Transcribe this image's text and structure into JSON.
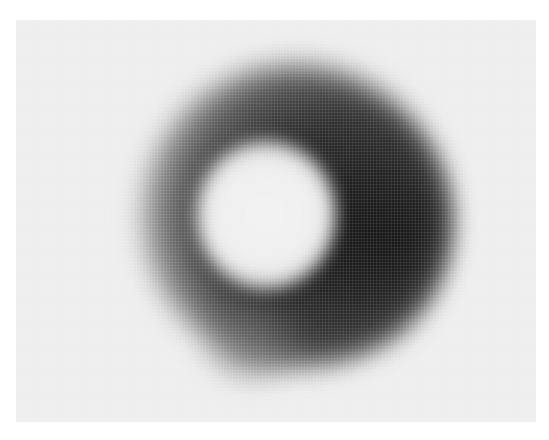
{
  "image": {
    "subject": "blurred dark ring",
    "background_color": "#eeeeee",
    "ring_color_dark": "#1a1a1a",
    "ring_color_mid": "#555555",
    "center_color": "#f2f2f2"
  }
}
